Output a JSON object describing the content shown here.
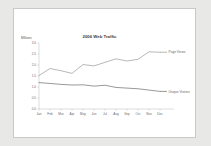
{
  "chart_data": {
    "type": "line",
    "title": "2006 Web Traffic",
    "xlabel": "",
    "ylabel": "Millions",
    "categories": [
      "Jan",
      "Feb",
      "Mar",
      "Apr",
      "May",
      "Jun",
      "Jul",
      "Aug",
      "Sep",
      "Oct",
      "Nov",
      "Dec"
    ],
    "series": [
      {
        "name": "Page Views",
        "color": "#9a9a9a",
        "values": [
          1.52,
          1.84,
          1.74,
          1.62,
          2.02,
          1.96,
          2.12,
          2.28,
          2.18,
          2.26,
          2.6,
          2.58
        ]
      },
      {
        "name": "Unique Visitors",
        "color": "#6d6d6d",
        "values": [
          1.2,
          1.16,
          1.12,
          1.09,
          1.1,
          1.04,
          1.08,
          0.98,
          0.95,
          0.92,
          0.86,
          0.8
        ]
      }
    ],
    "ylim": [
      0.0,
      3.0
    ],
    "ytick_labels": [
      "3.0",
      "2.5",
      "2.0",
      "1.5",
      "1.0",
      "0.5",
      "0.0"
    ],
    "ytick_values": [
      3.0,
      2.5,
      2.0,
      1.5,
      1.0,
      0.5,
      0.0
    ],
    "grid": false,
    "legend_position": "right-inline"
  },
  "colors": {
    "page_background": "#e8e8e6",
    "panel_background": "#ffffff",
    "panel_border": "#c9c9c9",
    "axis": "#bbbbbb",
    "text": "#6a6a6a",
    "title_text": "#3a3a3a"
  }
}
